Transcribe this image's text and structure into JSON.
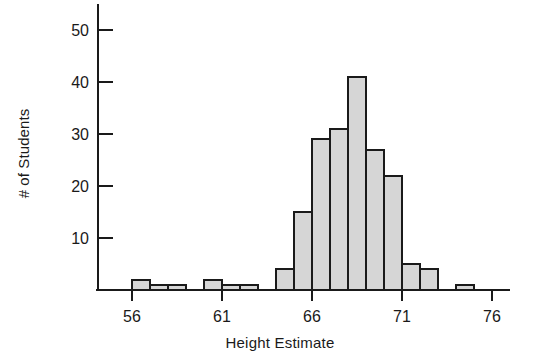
{
  "chart_data": {
    "type": "bar",
    "title": "",
    "xlabel": "Height Estimate",
    "ylabel": "# of Students",
    "categories": [
      "56",
      "57",
      "58",
      "59",
      "60",
      "61",
      "62",
      "63",
      "64",
      "65",
      "66",
      "67",
      "68",
      "69",
      "70",
      "71",
      "72",
      "73",
      "74",
      "75"
    ],
    "bin_starts": [
      56,
      57,
      58,
      59,
      60,
      61,
      62,
      63,
      64,
      65,
      66,
      67,
      68,
      69,
      70,
      71,
      72,
      73,
      74,
      75
    ],
    "bin_width": 1,
    "values": [
      2,
      1,
      1,
      0,
      2,
      1,
      1,
      0,
      4,
      15,
      29,
      31,
      41,
      27,
      22,
      5,
      4,
      0,
      1,
      0
    ],
    "xlim": [
      54,
      77
    ],
    "ylim": [
      0,
      55
    ],
    "xticks": [
      56,
      61,
      66,
      71,
      76
    ],
    "xtick_labels": [
      "56",
      "61",
      "66",
      "71",
      "76"
    ],
    "yticks": [
      10,
      20,
      30,
      40,
      50
    ],
    "ytick_labels": [
      "10",
      "20",
      "30",
      "40",
      "50"
    ],
    "grid": false,
    "legend": null,
    "bar_fill_color": "#d6d6d6",
    "bar_edge_color": "#1a1a1a",
    "axis_color": "#1a1a1a"
  }
}
